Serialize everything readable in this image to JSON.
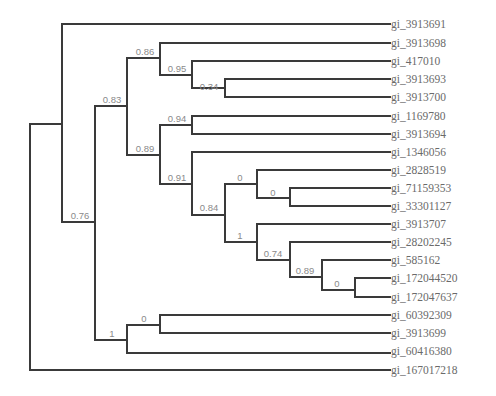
{
  "diagram": {
    "type": "phylogenetic-tree",
    "leaves": [
      {
        "label": "gi_3913691",
        "y": 24
      },
      {
        "label": "gi_3913698",
        "y": 43
      },
      {
        "label": "gi_417010",
        "y": 61
      },
      {
        "label": "gi_3913693",
        "y": 79
      },
      {
        "label": "gi_3913700",
        "y": 97
      },
      {
        "label": "gi_1169780",
        "y": 116
      },
      {
        "label": "gi_3913694",
        "y": 134
      },
      {
        "label": "gi_1346056",
        "y": 152
      },
      {
        "label": "gi_2828519",
        "y": 170
      },
      {
        "label": "gi_71159353",
        "y": 188
      },
      {
        "label": "gi_33301127",
        "y": 206
      },
      {
        "label": "gi_3913707",
        "y": 224
      },
      {
        "label": "gi_28202245",
        "y": 242
      },
      {
        "label": "gi_585162",
        "y": 260
      },
      {
        "label": "gi_172044520",
        "y": 278
      },
      {
        "label": "gi_172047637",
        "y": 297
      },
      {
        "label": "gi_60392309",
        "y": 315
      },
      {
        "label": "gi_3913699",
        "y": 333
      },
      {
        "label": "gi_60416380",
        "y": 351
      },
      {
        "label": "gi_167017218",
        "y": 370
      }
    ],
    "support_values": [
      {
        "label": "0.86",
        "x": 145,
        "y": 55
      },
      {
        "label": "0.95",
        "x": 177,
        "y": 72
      },
      {
        "label": "0.34",
        "x": 209,
        "y": 90
      },
      {
        "label": "0.83",
        "x": 112,
        "y": 103
      },
      {
        "label": "0.94",
        "x": 177,
        "y": 123
      },
      {
        "label": "0.89",
        "x": 145,
        "y": 151
      },
      {
        "label": "0.91",
        "x": 177,
        "y": 181
      },
      {
        "label": "0",
        "x": 240,
        "y": 181
      },
      {
        "label": "0",
        "x": 273,
        "y": 197
      },
      {
        "label": "0.84",
        "x": 209,
        "y": 212
      },
      {
        "label": "1",
        "x": 240,
        "y": 239
      },
      {
        "label": "0.74",
        "x": 273,
        "y": 257
      },
      {
        "label": "0.89",
        "x": 305,
        "y": 274
      },
      {
        "label": "0",
        "x": 337,
        "y": 288
      },
      {
        "label": "0.76",
        "x": 80,
        "y": 219
      },
      {
        "label": "0",
        "x": 144,
        "y": 322
      },
      {
        "label": "1",
        "x": 112,
        "y": 337
      }
    ]
  }
}
